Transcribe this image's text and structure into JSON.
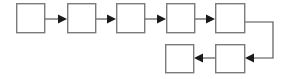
{
  "diagram": {
    "type": "flowchart",
    "canvas": {
      "width": 283,
      "height": 79,
      "background": "#ffffff"
    },
    "style": {
      "box_fill": "#ffffff",
      "box_stroke": "#7b7b7b",
      "box_stroke_width": 1.4,
      "connector_stroke": "#4a4a4a",
      "connector_stroke_width": 1.1,
      "arrow_fill": "#1a1a1a"
    },
    "nodes": [
      {
        "id": "node-1",
        "label": "",
        "x": 16,
        "y": 3,
        "width": 29,
        "height": 30,
        "row": "top"
      },
      {
        "id": "node-2",
        "label": "",
        "x": 67,
        "y": 3,
        "width": 29,
        "height": 30,
        "row": "top"
      },
      {
        "id": "node-3",
        "label": "",
        "x": 116,
        "y": 3,
        "width": 29,
        "height": 30,
        "row": "top"
      },
      {
        "id": "node-4",
        "label": "",
        "x": 166,
        "y": 3,
        "width": 29,
        "height": 30,
        "row": "top"
      },
      {
        "id": "node-5",
        "label": "",
        "x": 215,
        "y": 3,
        "width": 30,
        "height": 30,
        "row": "top"
      },
      {
        "id": "node-6",
        "label": "",
        "x": 215,
        "y": 44,
        "width": 30,
        "height": 29,
        "row": "bottom"
      },
      {
        "id": "node-7",
        "label": "",
        "x": 165,
        "y": 44,
        "width": 29,
        "height": 29,
        "row": "bottom"
      }
    ],
    "edges": [
      {
        "id": "edge-1-2",
        "from": "node-1",
        "to": "node-2",
        "direction": "right",
        "kind": "straight"
      },
      {
        "id": "edge-2-3",
        "from": "node-2",
        "to": "node-3",
        "direction": "right",
        "kind": "straight"
      },
      {
        "id": "edge-3-4",
        "from": "node-3",
        "to": "node-4",
        "direction": "right",
        "kind": "straight"
      },
      {
        "id": "edge-4-5",
        "from": "node-4",
        "to": "node-5",
        "direction": "right",
        "kind": "straight"
      },
      {
        "id": "edge-5-6",
        "from": "node-5",
        "to": "node-6",
        "direction": "left",
        "kind": "elbow"
      },
      {
        "id": "edge-6-7",
        "from": "node-6",
        "to": "node-7",
        "direction": "left",
        "kind": "straight"
      }
    ]
  }
}
